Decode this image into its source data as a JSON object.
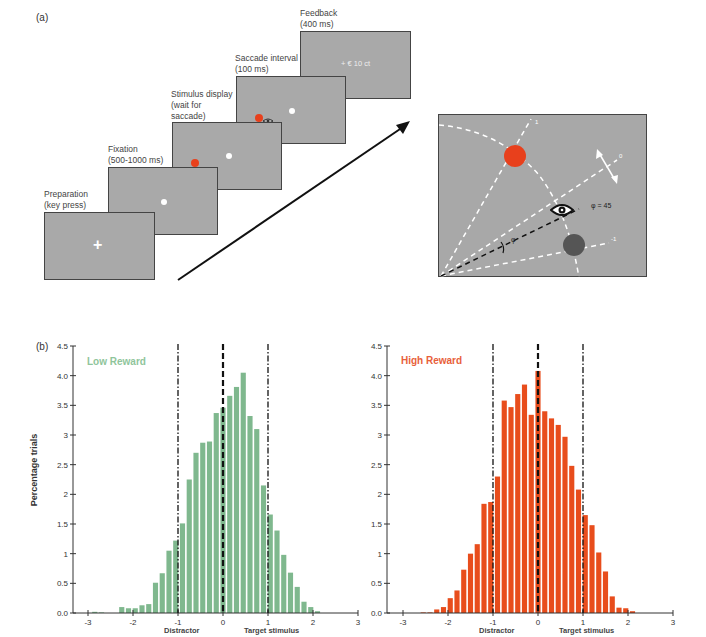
{
  "panel_a": {
    "label": "(a)",
    "steps": [
      {
        "title": "Preparation\n(key press)",
        "content": "+"
      },
      {
        "title": "Fixation\n(500-1000 ms)",
        "content": ""
      },
      {
        "title": "Stimulus display\n(wait for\nsaccade)",
        "content": ""
      },
      {
        "title": "Saccade interval\n(100 ms)",
        "content": ""
      },
      {
        "title": "Feedback\n(400 ms)",
        "content": "+ € 10 ct"
      }
    ],
    "detail": {
      "angle_label": "φ",
      "angle_value_label": "φ = 45",
      "end_labels": [
        "1",
        "0",
        "-1"
      ]
    }
  },
  "panel_b": {
    "label": "(b)",
    "ylabel": "Percentage trials",
    "xlabel_left": "Distractor",
    "xlabel_right": "Target stimulus"
  },
  "colors": {
    "low_reward": "#7fb88e",
    "high_reward": "#e84d1c",
    "low_reward_title": "#8fc59b",
    "high_reward_title": "#e8603a",
    "screen_gray": "#a9a9a9",
    "red_dot": "#e8401c",
    "dark_dot": "#555555"
  },
  "chart_data": [
    {
      "type": "bar",
      "title": "Low Reward",
      "xlabel": "",
      "ylabel": "Percentage trials",
      "xlim": [
        -3,
        3
      ],
      "ylim": [
        0,
        4.5
      ],
      "yticks": [
        "0.0",
        "0.5",
        "1",
        "1.5",
        "2",
        "2.5",
        "3",
        "3.5",
        "4.0",
        "4.5"
      ],
      "xticks": [
        "-3",
        "-2",
        "-1",
        "0",
        "1",
        "2",
        "3"
      ],
      "x_annotations": {
        "-1": "Distractor",
        "1": "Target stimulus"
      },
      "reference_lines": [
        {
          "x": -1,
          "style": "dash-dot"
        },
        {
          "x": 0,
          "style": "dashed"
        },
        {
          "x": 1,
          "style": "dash-dot"
        }
      ],
      "grid": false,
      "bin_width": 0.15,
      "x": [
        -2.85,
        -2.7,
        -2.55,
        -2.4,
        -2.25,
        -2.1,
        -1.95,
        -1.8,
        -1.65,
        -1.5,
        -1.35,
        -1.2,
        -1.05,
        -0.9,
        -0.75,
        -0.6,
        -0.45,
        -0.3,
        -0.15,
        0.0,
        0.15,
        0.3,
        0.45,
        0.6,
        0.75,
        0.9,
        1.05,
        1.2,
        1.35,
        1.5,
        1.65,
        1.8,
        1.95,
        2.1,
        2.25,
        2.4
      ],
      "values": [
        0.02,
        0.01,
        0.0,
        0.0,
        0.1,
        0.08,
        0.08,
        0.13,
        0.15,
        0.51,
        0.67,
        1.05,
        1.22,
        1.51,
        2.25,
        2.7,
        2.87,
        2.89,
        3.37,
        3.46,
        3.66,
        3.81,
        4.05,
        3.32,
        3.1,
        2.15,
        1.66,
        1.39,
        0.98,
        0.68,
        0.44,
        0.19,
        0.1,
        0.03,
        0.0,
        0.0
      ]
    },
    {
      "type": "bar",
      "title": "High Reward",
      "xlabel": "",
      "ylabel": "",
      "xlim": [
        -3,
        3
      ],
      "ylim": [
        0,
        4.5
      ],
      "yticks": [
        "0.0",
        "0.5",
        "1",
        "1.5",
        "2",
        "2.5",
        "3",
        "3.5",
        "4.0",
        "4.5"
      ],
      "xticks": [
        "-3",
        "-2",
        "-1",
        "0",
        "1",
        "2",
        "3"
      ],
      "x_annotations": {
        "-1": "Distractor",
        "1": "Target stimulus"
      },
      "reference_lines": [
        {
          "x": -1,
          "style": "dash-dot"
        },
        {
          "x": 0,
          "style": "dashed"
        },
        {
          "x": 1,
          "style": "dash-dot"
        }
      ],
      "grid": false,
      "bin_width": 0.15,
      "x": [
        -2.85,
        -2.7,
        -2.55,
        -2.4,
        -2.25,
        -2.1,
        -1.95,
        -1.8,
        -1.65,
        -1.5,
        -1.35,
        -1.2,
        -1.05,
        -0.9,
        -0.75,
        -0.6,
        -0.45,
        -0.3,
        -0.15,
        0.0,
        0.15,
        0.3,
        0.45,
        0.6,
        0.75,
        0.9,
        1.05,
        1.2,
        1.35,
        1.5,
        1.65,
        1.8,
        1.95,
        2.1,
        2.25,
        2.4
      ],
      "values": [
        0.0,
        0.0,
        0.01,
        0.01,
        0.06,
        0.1,
        0.25,
        0.38,
        0.73,
        1.0,
        1.16,
        1.84,
        1.87,
        2.3,
        3.58,
        3.47,
        3.69,
        3.85,
        3.34,
        4.08,
        3.4,
        3.28,
        3.17,
        2.97,
        2.48,
        2.08,
        1.65,
        1.48,
        1.02,
        0.7,
        0.28,
        0.09,
        0.08,
        0.03,
        0.0,
        0.0
      ]
    }
  ]
}
